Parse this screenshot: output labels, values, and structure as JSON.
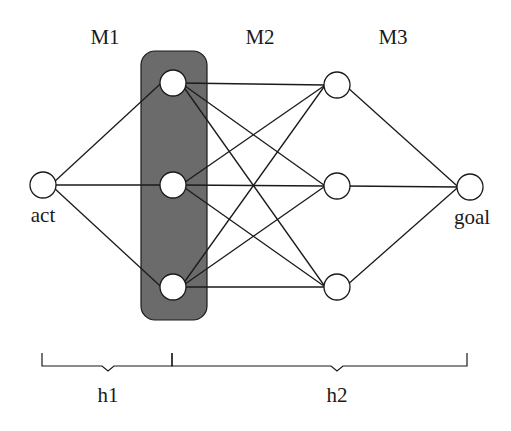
{
  "diagram": {
    "type": "layered-network",
    "colors": {
      "background": "#ffffff",
      "stroke": "#1a1a1a",
      "node_fill": "#ffffff",
      "highlight_fill": "#6b6b6b"
    },
    "layer_labels": [
      {
        "id": "M1",
        "text": "M1",
        "x": 105,
        "y": 44
      },
      {
        "id": "M2",
        "text": "M2",
        "x": 260,
        "y": 44
      },
      {
        "id": "M3",
        "text": "M3",
        "x": 393,
        "y": 44
      }
    ],
    "nodes": [
      {
        "id": "act",
        "x": 43,
        "y": 185,
        "r": 13,
        "label": "act",
        "label_x": 43,
        "label_y": 222
      },
      {
        "id": "m1a",
        "x": 173,
        "y": 83,
        "r": 13
      },
      {
        "id": "m1b",
        "x": 173,
        "y": 185,
        "r": 13
      },
      {
        "id": "m1c",
        "x": 173,
        "y": 287,
        "r": 13
      },
      {
        "id": "m2a",
        "x": 337,
        "y": 85,
        "r": 13
      },
      {
        "id": "m2b",
        "x": 337,
        "y": 186,
        "r": 13
      },
      {
        "id": "m2c",
        "x": 337,
        "y": 287,
        "r": 13
      },
      {
        "id": "goal",
        "x": 470,
        "y": 187,
        "r": 13,
        "label": "goal",
        "label_x": 472,
        "label_y": 224
      }
    ],
    "edges": [
      [
        "act",
        "m1a"
      ],
      [
        "act",
        "m1b"
      ],
      [
        "act",
        "m1c"
      ],
      [
        "m1a",
        "m2a"
      ],
      [
        "m1a",
        "m2b"
      ],
      [
        "m1a",
        "m2c"
      ],
      [
        "m1b",
        "m2a"
      ],
      [
        "m1b",
        "m2b"
      ],
      [
        "m1b",
        "m2c"
      ],
      [
        "m1c",
        "m2a"
      ],
      [
        "m1c",
        "m2b"
      ],
      [
        "m1c",
        "m2c"
      ],
      [
        "m2a",
        "goal"
      ],
      [
        "m2b",
        "goal"
      ],
      [
        "m2c",
        "goal"
      ]
    ],
    "highlight_box": {
      "label": "M1 highlighted group",
      "x": 141,
      "y": 51,
      "width": 66,
      "height": 269,
      "rx": 14
    },
    "braces": [
      {
        "id": "h1",
        "label": "h1",
        "x1": 42,
        "x2": 172,
        "notch_x": 108,
        "label_x": 108,
        "label_y": 402
      },
      {
        "id": "h2",
        "label": "h2",
        "x1": 172,
        "x2": 467,
        "notch_x": 337,
        "label_x": 337,
        "label_y": 402
      }
    ],
    "brace_geometry": {
      "top_y": 353,
      "line_y": 366,
      "notch_depth": 5
    }
  }
}
